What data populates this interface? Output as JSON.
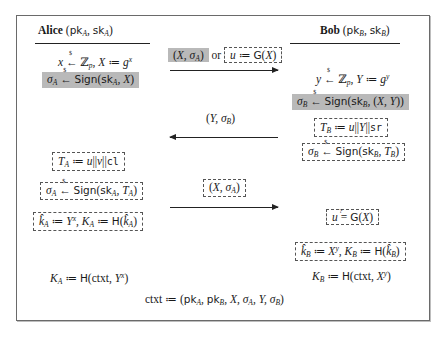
{
  "protocol": {
    "alice": {
      "name": "Alice",
      "keys": "(pk_A, sk_A)",
      "steps": [
        {
          "id": "a1",
          "text": "x ←$ Z_p, X := g^x",
          "style": "plain"
        },
        {
          "id": "a2",
          "text": "σ_A ←$ Sign(sk_A, X)",
          "style": "gray"
        },
        {
          "id": "a3",
          "text": "T_A := u||v||cl",
          "style": "dashed"
        },
        {
          "id": "a4",
          "text": "σ_A ←$ Sign(sk_A, T_A)",
          "style": "dashed"
        },
        {
          "id": "a5",
          "text": "k̂_A := Y^x, K_A := H(k̂_A)",
          "style": "dashed"
        },
        {
          "id": "a6",
          "text": "K_A := H(ctxt, Y^x)",
          "style": "plain"
        }
      ]
    },
    "bob": {
      "name": "Bob",
      "keys": "(pk_B, sk_B)",
      "steps": [
        {
          "id": "b1",
          "text": "y ←$ Z_p, Y := g^y",
          "style": "plain"
        },
        {
          "id": "b2",
          "text": "σ_B ←$ Sign(sk_B, (X, Y))",
          "style": "gray"
        },
        {
          "id": "b3",
          "text": "T_B := u||Y||sr",
          "style": "dashed"
        },
        {
          "id": "b4",
          "text": "σ_B ←$ Sign(sk_B, T_B)",
          "style": "dashed"
        },
        {
          "id": "b5",
          "text": "u =? G(X)",
          "style": "dashed"
        },
        {
          "id": "b6",
          "text": "k̂_B := X^y, K_B := H(k̂_B)",
          "style": "dashed"
        },
        {
          "id": "b7",
          "text": "K_B := H(ctxt, X^y)",
          "style": "plain"
        }
      ]
    },
    "messages": [
      {
        "id": "m1",
        "direction": "right",
        "gray_part": "(X, σ_A)",
        "connector": "or",
        "dashed_part": "u := G(X)"
      },
      {
        "id": "m2",
        "direction": "left",
        "label": "(Y, σ_B)"
      },
      {
        "id": "m3",
        "direction": "right",
        "label": "(X, σ_A)",
        "style": "dashed"
      }
    ],
    "footer": "ctxt := (pk_A, pk_B, X, σ_A, Y, σ_B)",
    "colors": {
      "gray_fill": "#b9b9b9",
      "frame": "#6a6a6a",
      "text": "#1a1a1a"
    },
    "labels": {
      "or": "or",
      "alice_name": "Alice",
      "bob_name": "Bob"
    }
  }
}
